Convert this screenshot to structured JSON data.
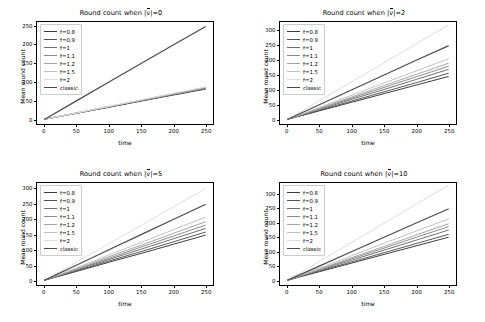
{
  "figure": {
    "rows": 2,
    "cols": 2,
    "background": "#ffffff"
  },
  "series_names": [
    "f=0.8",
    "f=0.9",
    "f=1",
    "f=1.1",
    "f=1.2",
    "f=1.5",
    "f=2",
    "classic"
  ],
  "series_colors": [
    "#3b3b3b",
    "#545454",
    "#6e6e6e",
    "#8a8a8a",
    "#a5a5a5",
    "#c0c0c0",
    "#dcdcdc",
    "#4a4a4a"
  ],
  "axis_labels": {
    "x": "time",
    "y": "Mean round count"
  },
  "chart_data": [
    {
      "type": "line",
      "id": "v0",
      "title": "Round count when |v⃗|=0",
      "title_prefix": "Round count when |",
      "title_vec": "v",
      "title_suffix": "|=0",
      "xlabel": "time",
      "ylabel": "Mean round count",
      "xlim": [
        -12,
        262
      ],
      "ylim": [
        -13,
        262
      ],
      "xticks": [
        0,
        50,
        100,
        150,
        200,
        250
      ],
      "yticks": [
        0,
        50,
        100,
        150,
        200,
        250
      ],
      "grid": false,
      "legend_position": "upper left",
      "x": [
        0,
        50,
        100,
        150,
        200,
        250
      ],
      "series": [
        {
          "name": "f=0.8",
          "values": [
            0,
            16,
            32,
            49,
            65,
            81
          ]
        },
        {
          "name": "f=0.9",
          "values": [
            0,
            16,
            33,
            49,
            66,
            82
          ]
        },
        {
          "name": "f=1",
          "values": [
            0,
            17,
            33,
            50,
            67,
            83
          ]
        },
        {
          "name": "f=1.1",
          "values": [
            0,
            17,
            34,
            51,
            67,
            84
          ]
        },
        {
          "name": "f=1.2",
          "values": [
            0,
            17,
            34,
            51,
            68,
            85
          ]
        },
        {
          "name": "f=1.5",
          "values": [
            0,
            17,
            34,
            52,
            69,
            86
          ]
        },
        {
          "name": "f=2",
          "values": [
            0,
            17,
            35,
            52,
            70,
            87
          ]
        },
        {
          "name": "classic",
          "values": [
            0,
            50,
            100,
            150,
            200,
            249
          ]
        }
      ]
    },
    {
      "type": "line",
      "id": "v2",
      "title": "Round count when |v⃗|=2",
      "title_prefix": "Round count when |",
      "title_vec": "v",
      "title_suffix": "|=2",
      "xlabel": "time",
      "ylabel": "Mean round count",
      "xlim": [
        -12,
        262
      ],
      "ylim": [
        -16,
        330
      ],
      "xticks": [
        0,
        50,
        100,
        150,
        200,
        250
      ],
      "yticks": [
        0,
        50,
        100,
        150,
        200,
        250,
        300
      ],
      "grid": false,
      "legend_position": "upper left",
      "x": [
        0,
        50,
        100,
        150,
        200,
        250
      ],
      "series": [
        {
          "name": "f=0.8",
          "values": [
            0,
            29,
            58,
            87,
            116,
            145
          ]
        },
        {
          "name": "f=0.9",
          "values": [
            0,
            31,
            62,
            93,
            124,
            156
          ]
        },
        {
          "name": "f=1",
          "values": [
            0,
            34,
            68,
            101,
            135,
            169
          ]
        },
        {
          "name": "f=1.1",
          "values": [
            0,
            36,
            72,
            108,
            144,
            180
          ]
        },
        {
          "name": "f=1.2",
          "values": [
            0,
            38,
            76,
            114,
            152,
            190
          ]
        },
        {
          "name": "f=1.5",
          "values": [
            0,
            41,
            82,
            123,
            164,
            205
          ]
        },
        {
          "name": "f=2",
          "values": [
            0,
            64,
            128,
            192,
            256,
            320
          ]
        },
        {
          "name": "classic",
          "values": [
            0,
            50,
            100,
            150,
            200,
            249
          ]
        }
      ]
    },
    {
      "type": "line",
      "id": "v5",
      "title": "Round count when |v⃗|=5",
      "title_prefix": "Round count when |",
      "title_vec": "v",
      "title_suffix": "|=5",
      "xlabel": "time",
      "ylabel": "Mean round count",
      "xlim": [
        -12,
        262
      ],
      "ylim": [
        -16,
        320
      ],
      "xticks": [
        0,
        50,
        100,
        150,
        200,
        250
      ],
      "yticks": [
        0,
        50,
        100,
        150,
        200,
        250,
        300
      ],
      "grid": false,
      "legend_position": "upper left",
      "x": [
        0,
        50,
        100,
        150,
        200,
        250
      ],
      "series": [
        {
          "name": "f=0.8",
          "values": [
            0,
            29,
            59,
            88,
            118,
            148
          ]
        },
        {
          "name": "f=0.9",
          "values": [
            0,
            31,
            63,
            94,
            126,
            158
          ]
        },
        {
          "name": "f=1",
          "values": [
            0,
            34,
            68,
            102,
            136,
            170
          ]
        },
        {
          "name": "f=1.1",
          "values": [
            0,
            36,
            72,
            109,
            145,
            181
          ]
        },
        {
          "name": "f=1.2",
          "values": [
            0,
            38,
            77,
            115,
            154,
            192
          ]
        },
        {
          "name": "f=1.5",
          "values": [
            0,
            41,
            83,
            124,
            166,
            207
          ]
        },
        {
          "name": "f=2",
          "values": [
            0,
            60,
            120,
            180,
            241,
            301
          ]
        },
        {
          "name": "classic",
          "values": [
            0,
            50,
            100,
            150,
            200,
            249
          ]
        }
      ]
    },
    {
      "type": "line",
      "id": "v10",
      "title": "Round count when |v⃗|=10",
      "title_prefix": "Round count when |",
      "title_vec": "v",
      "title_suffix": "|=10",
      "xlabel": "time",
      "ylabel": "Mean round count",
      "xlim": [
        -12,
        262
      ],
      "ylim": [
        -17,
        340
      ],
      "xticks": [
        0,
        50,
        100,
        150,
        200,
        250
      ],
      "yticks": [
        0,
        50,
        100,
        150,
        200,
        250,
        300
      ],
      "grid": false,
      "legend_position": "upper left",
      "x": [
        0,
        50,
        100,
        150,
        200,
        250
      ],
      "series": [
        {
          "name": "f=0.8",
          "values": [
            0,
            30,
            60,
            90,
            120,
            150
          ]
        },
        {
          "name": "f=0.9",
          "values": [
            0,
            32,
            64,
            96,
            128,
            160
          ]
        },
        {
          "name": "f=1",
          "values": [
            0,
            35,
            70,
            105,
            140,
            175
          ]
        },
        {
          "name": "f=1.1",
          "values": [
            0,
            37,
            75,
            112,
            150,
            187
          ]
        },
        {
          "name": "f=1.2",
          "values": [
            0,
            39,
            79,
            118,
            158,
            197
          ]
        },
        {
          "name": "f=1.5",
          "values": [
            0,
            43,
            86,
            129,
            172,
            214
          ]
        },
        {
          "name": "f=2",
          "values": [
            0,
            66,
            133,
            199,
            266,
            332
          ]
        },
        {
          "name": "classic",
          "values": [
            0,
            50,
            100,
            150,
            200,
            249
          ]
        }
      ]
    }
  ]
}
